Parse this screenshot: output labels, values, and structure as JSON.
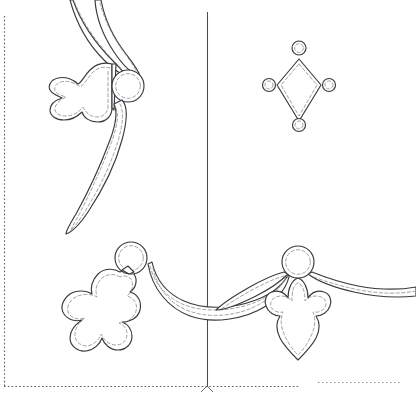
{
  "sheet": {
    "title": "Appliqué Quilting Pattern Template",
    "width": 416,
    "height": 400,
    "background_color": "#ffffff",
    "outline_color": "#3a3a3e",
    "stitch_color": "#8f8f96",
    "guide_color": "#4a4a50",
    "border_color": "#5e5e66"
  },
  "guides": {
    "center_vertical": {
      "label": "center-fold-line",
      "x": 207,
      "y_start": 12,
      "y_end": 386
    },
    "left_border": {
      "label": "left-edge-dotted-border",
      "x": 4,
      "y_start": 16,
      "y_end": 386
    },
    "bottom_border": {
      "label": "bottom-edge-dotted-border",
      "y": 386,
      "x_start": 4,
      "x_end": 300
    },
    "bottom_border_right": {
      "label": "bottom-edge-dotted-border-right-segment",
      "y": 382,
      "x_start": 318,
      "x_end": 400
    },
    "registration_ticks": {
      "label": "registration-ticks",
      "x": 207,
      "y": 386
    }
  },
  "motifs": [
    {
      "id": "upper-left-corner-cluster",
      "name": "Upper left corner cluster",
      "parts": [
        "trefoil-leaf",
        "center-circle",
        "upper-crescent-swag",
        "lower-crescent-swag"
      ],
      "circle": {
        "cx": 128,
        "cy": 86,
        "r": 16
      }
    },
    {
      "id": "diamond-cluster",
      "name": "Diamond with four corner dots",
      "parts": [
        "diamond",
        "dot-top",
        "dot-left",
        "dot-right",
        "dot-bottom"
      ],
      "diamond": {
        "cx": 299,
        "cy": 85,
        "half_width": 22,
        "half_height": 44
      },
      "dots": [
        {
          "label": "dot-top",
          "cx": 299,
          "cy": 48,
          "r": 7
        },
        {
          "label": "dot-left",
          "cx": 269,
          "cy": 85,
          "r": 6.5
        },
        {
          "label": "dot-right",
          "cx": 329,
          "cy": 85,
          "r": 6.5
        },
        {
          "label": "dot-bottom",
          "cx": 299,
          "cy": 125,
          "r": 6.5
        }
      ]
    },
    {
      "id": "lower-left-corner-cluster",
      "name": "Lower left corner cluster",
      "parts": [
        "oak-leaf",
        "center-circle",
        "swag-arm"
      ],
      "circle": {
        "cx": 131,
        "cy": 258,
        "r": 16
      }
    },
    {
      "id": "bottom-center-swag",
      "name": "Bottom centre hanging swag",
      "parts": [
        "swag-bowl"
      ]
    },
    {
      "id": "lower-right-cluster",
      "name": "Lower right bud cluster",
      "parts": [
        "bud-fleur",
        "center-circle",
        "left-swag-arm",
        "right-swag-arm"
      ],
      "circle": {
        "cx": 298,
        "cy": 262,
        "r": 16
      }
    }
  ]
}
